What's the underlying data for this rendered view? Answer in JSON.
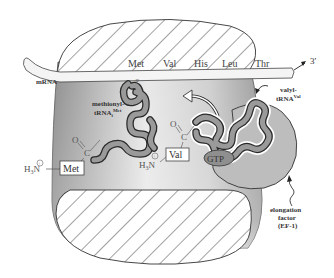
{
  "diagram": {
    "mrna": {
      "label": "mRNA",
      "end_label": "3′",
      "codons": [
        "Met",
        "Val",
        "His",
        "Leu",
        "Thr"
      ]
    },
    "trna_left": {
      "label_line1": "methionyl-",
      "label_line2": "tRNA",
      "label_sub": "i",
      "label_sup": "Met"
    },
    "trna_right": {
      "label_line1": "valyl-",
      "label_line2": "tRNA",
      "label_sup": "Val"
    },
    "amino_acid_left": {
      "amine": "H",
      "amine_sub": "3",
      "amine_n": "N",
      "charge": "+",
      "residue": "Met",
      "carbonyl_o": "O",
      "carbonyl_c": "C"
    },
    "amino_acid_right": {
      "amine": "H",
      "amine_sub": "3",
      "amine_n": "N",
      "charge": "+",
      "residue": "Val",
      "carbonyl_o": "O",
      "carbonyl_c": "C"
    },
    "gtp_label": "GTP",
    "elongation_factor": {
      "line1": "elongation",
      "line2": "factor",
      "line3": "(EF-1)"
    },
    "colors": {
      "ribosome_dark": "#8a8a8a",
      "ribosome_light": "#f2f2f2",
      "trna_fill": "#9a9a9a",
      "trna_stroke": "#2a2a2a",
      "ef_fill": "#bdbdbd",
      "hatch": "#444444",
      "mrna_fill": "#f4f4f4"
    }
  }
}
